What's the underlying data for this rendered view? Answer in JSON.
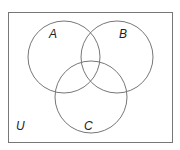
{
  "diagram": {
    "type": "venn",
    "universe_label": "U",
    "sets": [
      {
        "label": "A",
        "cx": 64,
        "cy": 57,
        "r": 36,
        "label_x": 52,
        "label_y": 39
      },
      {
        "label": "B",
        "cx": 117,
        "cy": 57,
        "r": 36,
        "label_x": 123,
        "label_y": 39
      },
      {
        "label": "C",
        "cx": 91,
        "cy": 97,
        "r": 36,
        "label_x": 87,
        "label_y": 131
      }
    ],
    "universe_label_pos": {
      "x": 18,
      "y": 130
    },
    "colors": {
      "stroke": "#777777",
      "background": "#ffffff"
    }
  }
}
